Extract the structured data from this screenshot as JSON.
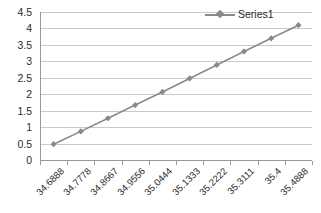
{
  "chart_data": {
    "type": "line",
    "title": "",
    "subtitle": "",
    "xlabel": "",
    "ylabel": "",
    "grid": true,
    "legend_position": "top-right",
    "ylim": [
      0,
      4.5
    ],
    "y_ticks": [
      "0",
      "0.5",
      "1",
      "1.5",
      "2",
      "2.5",
      "3",
      "3.5",
      "4",
      "4.5"
    ],
    "y_tick_values": [
      0,
      0.5,
      1,
      1.5,
      2,
      2.5,
      3,
      3.5,
      4,
      4.5
    ],
    "categories": [
      "34.6888",
      "34.7778",
      "34.8667",
      "34.9556",
      "35.0444",
      "35.1333",
      "35.2222",
      "35.3111",
      "35.4",
      "35.4888"
    ],
    "series": [
      {
        "name": "Series1",
        "color": "#8a8a8a",
        "marker": "diamond",
        "values": [
          0.48,
          0.87,
          1.27,
          1.67,
          2.07,
          2.48,
          2.89,
          3.3,
          3.7,
          4.1
        ]
      }
    ]
  },
  "legend": {
    "entries": [
      {
        "label": "Series1",
        "marker": "line-diamond-marker",
        "color": "#8a8a8a"
      }
    ]
  },
  "colors": {
    "series": "#8a8a8a",
    "gridline": "#c9c9c9",
    "axis": "#9a9a9a",
    "text": "#2b2b2b",
    "background": "#ffffff"
  }
}
